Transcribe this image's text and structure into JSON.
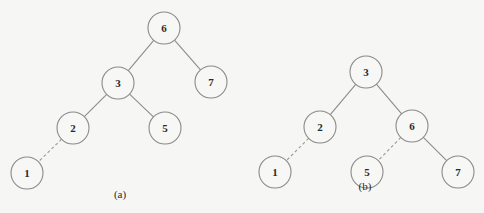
{
  "diagram": {
    "node_radius": 16,
    "colors": {
      "stroke": "#8a8a8a",
      "text": "#2a2a2a",
      "background": "#f6f6f4"
    },
    "trees": [
      {
        "caption": "(a)",
        "caption_pos": [
          120,
          198
        ],
        "nodes": [
          {
            "id": "a6",
            "label": "6",
            "x": 164,
            "y": 28
          },
          {
            "id": "a3",
            "label": "3",
            "x": 118,
            "y": 83
          },
          {
            "id": "a7",
            "label": "7",
            "x": 211,
            "y": 82
          },
          {
            "id": "a2",
            "label": "2",
            "x": 73,
            "y": 128
          },
          {
            "id": "a5",
            "label": "5",
            "x": 165,
            "y": 128
          },
          {
            "id": "a1",
            "label": "1",
            "x": 27,
            "y": 173
          }
        ],
        "edges": [
          {
            "from": "a6",
            "to": "a3",
            "style": "solid"
          },
          {
            "from": "a6",
            "to": "a7",
            "style": "solid"
          },
          {
            "from": "a3",
            "to": "a2",
            "style": "solid"
          },
          {
            "from": "a3",
            "to": "a5",
            "style": "solid"
          },
          {
            "from": "a2",
            "to": "a1",
            "style": "dashed"
          }
        ]
      },
      {
        "caption": "(b)",
        "caption_pos": [
          365,
          190
        ],
        "nodes": [
          {
            "id": "b3",
            "label": "3",
            "x": 366,
            "y": 72
          },
          {
            "id": "b2",
            "label": "2",
            "x": 320,
            "y": 127
          },
          {
            "id": "b6",
            "label": "6",
            "x": 412,
            "y": 126
          },
          {
            "id": "b1",
            "label": "1",
            "x": 275,
            "y": 172
          },
          {
            "id": "b5",
            "label": "5",
            "x": 367,
            "y": 172
          },
          {
            "id": "b7",
            "label": "7",
            "x": 458,
            "y": 172
          }
        ],
        "edges": [
          {
            "from": "b3",
            "to": "b2",
            "style": "solid"
          },
          {
            "from": "b3",
            "to": "b6",
            "style": "solid"
          },
          {
            "from": "b2",
            "to": "b1",
            "style": "dashed"
          },
          {
            "from": "b6",
            "to": "b5",
            "style": "dashed"
          },
          {
            "from": "b6",
            "to": "b7",
            "style": "solid"
          }
        ]
      }
    ]
  }
}
